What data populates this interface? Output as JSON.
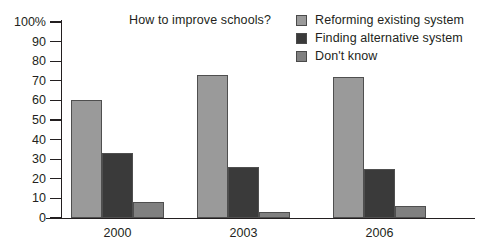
{
  "chart_data": {
    "type": "bar",
    "title": "How to improve schools?",
    "xlabel": "",
    "ylabel": "",
    "ylim": [
      0,
      100
    ],
    "y_ticks": [
      0,
      10,
      20,
      30,
      40,
      50,
      60,
      70,
      80,
      90,
      100
    ],
    "y_tick_labels": [
      "0",
      "10",
      "20",
      "30",
      "40",
      "50",
      "60",
      "70",
      "80",
      "90",
      "100%"
    ],
    "grid": false,
    "legend_position": "top-right",
    "categories": [
      "2000",
      "2003",
      "2006"
    ],
    "series": [
      {
        "name": "Reforming existing system",
        "color": "#9a9a9a",
        "values": [
          60,
          73,
          72
        ]
      },
      {
        "name": "Finding alternative system",
        "color": "#3a3a3a",
        "values": [
          33,
          26,
          25
        ]
      },
      {
        "name": "Don't know",
        "color": "#808080",
        "values": [
          8,
          3,
          6
        ]
      }
    ]
  },
  "colors": {
    "axis": "#231f20",
    "text": "#231f20",
    "bar_outline": "#4f4f4f",
    "background": "#ffffff"
  }
}
